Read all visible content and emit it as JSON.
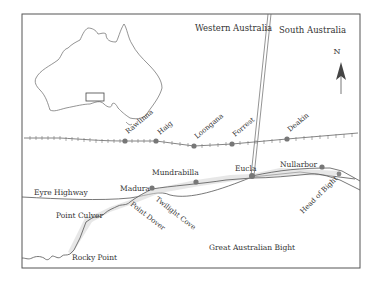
{
  "map": {
    "regions": {
      "western_australia": "Western Australia",
      "south_australia": "South Australia"
    },
    "north_label": "N",
    "railway_stations": [
      {
        "name": "Rawlinna",
        "x": 125,
        "y": 141,
        "lx": 128,
        "ly": 134
      },
      {
        "name": "Haig",
        "x": 156,
        "y": 141,
        "lx": 160,
        "ly": 135
      },
      {
        "name": "Loongana",
        "x": 194,
        "y": 146,
        "lx": 197,
        "ly": 139
      },
      {
        "name": "Forrest",
        "x": 232,
        "y": 144,
        "lx": 235,
        "ly": 137
      },
      {
        "name": "Deakin",
        "x": 287,
        "y": 139,
        "lx": 290,
        "ly": 132
      }
    ],
    "towns": [
      {
        "name": "Madura",
        "x": 152,
        "y": 188,
        "lx": 120,
        "ly": 191
      },
      {
        "name": "Mundrabilla",
        "x": 196,
        "y": 182,
        "lx": 152,
        "ly": 175
      },
      {
        "name": "Eucla",
        "x": 252,
        "y": 176,
        "lx": 235,
        "ly": 171
      },
      {
        "name": "Nullarbor",
        "x": 322,
        "y": 167,
        "lx": 280,
        "ly": 167
      },
      {
        "name": "Head of Bight",
        "x": 339,
        "y": 174
      }
    ],
    "features": {
      "highway": "Eyre Highway",
      "point_culver": "Point Culver",
      "point_dover": "Point Dover",
      "twilight_cove": "Twilight Cove",
      "rocky_point": "Rocky Point",
      "bight": "Great Australian Bight"
    },
    "colors": {
      "line": "#555555",
      "text": "#333333",
      "dot": "#777777",
      "dune": "#cccccc"
    }
  }
}
